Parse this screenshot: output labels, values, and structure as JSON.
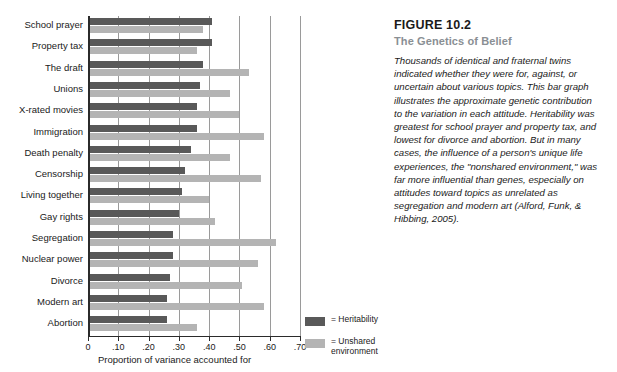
{
  "figure": {
    "number": "FIGURE 10.2",
    "title": "The Genetics of Belief",
    "body": "Thousands of identical and fraternal twins indicated whether they were for, against, or uncertain about various topics. This bar graph illustrates the approximate genetic contribution to the variation in each attitude.  Heritability was greatest for school prayer and property tax, and lowest for divorce and abortion. But in many cases, the influence of a person's unique life experiences, the \"nonshared environment,\" was far more influential than genes, especially on attitudes toward topics as unrelated as segregation and modern art (Alford, Funk, & Hibbing, 2005)."
  },
  "legend": {
    "items": [
      {
        "label": "= Heritability",
        "color": "#595959"
      },
      {
        "label": "= Unshared\nenvironment",
        "color": "#b4b4b4"
      }
    ]
  },
  "chart_data": {
    "type": "bar",
    "orientation": "horizontal",
    "title": "The Genetics of Belief",
    "xlabel": "Proportion of variance accounted for",
    "ylabel": "",
    "xlim": [
      0,
      0.7
    ],
    "grid": true,
    "gridlines": [
      0.1,
      0.2,
      0.3,
      0.4,
      0.5,
      0.6,
      0.7
    ],
    "tick_labels": [
      "0",
      ".10",
      ".20",
      ".30",
      ".40",
      ".50",
      ".60",
      ".70"
    ],
    "tick_values": [
      0,
      0.1,
      0.2,
      0.3,
      0.4,
      0.5,
      0.6,
      0.7
    ],
    "legend_position": "bottom-right",
    "categories": [
      "School prayer",
      "Property tax",
      "The draft",
      "Unions",
      "X-rated movies",
      "Immigration",
      "Death penalty",
      "Censorship",
      "Living together",
      "Gay rights",
      "Segregation",
      "Nuclear power",
      "Divorce",
      "Modern art",
      "Abortion"
    ],
    "series": [
      {
        "name": "Heritability",
        "color": "#595959",
        "values": [
          0.41,
          0.41,
          0.38,
          0.37,
          0.36,
          0.36,
          0.34,
          0.32,
          0.31,
          0.3,
          0.28,
          0.28,
          0.27,
          0.26,
          0.26
        ]
      },
      {
        "name": "Unshared environment",
        "color": "#b4b4b4",
        "values": [
          0.38,
          0.36,
          0.53,
          0.47,
          0.5,
          0.58,
          0.47,
          0.57,
          0.4,
          0.42,
          0.62,
          0.56,
          0.51,
          0.58,
          0.36
        ]
      }
    ]
  }
}
